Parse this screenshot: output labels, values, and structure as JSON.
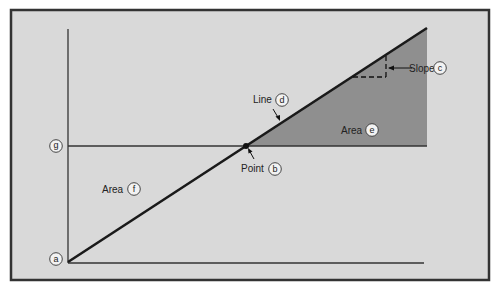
{
  "colors": {
    "background": "#d9d9d9",
    "frame": "#333333",
    "area_e_fill": "#8f8f8f",
    "line": "#1a1a1a",
    "circle_fill": "#f2f2f2"
  },
  "labels": {
    "a": {
      "letter": "a"
    },
    "b": {
      "text": "Point",
      "letter": "b"
    },
    "c": {
      "text": "Slope",
      "letter": "c"
    },
    "d": {
      "text": "Line",
      "letter": "d"
    },
    "e": {
      "text": "Area",
      "letter": "e"
    },
    "f": {
      "text": "Area",
      "letter": "f"
    },
    "g": {
      "letter": "g"
    }
  }
}
